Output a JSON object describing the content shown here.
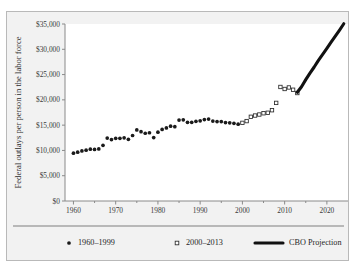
{
  "chart_data": {
    "type": "scatter",
    "title": "",
    "xlabel": "",
    "ylabel": "Federal outlays per person in the labor force",
    "xlim": [
      1958,
      2025
    ],
    "ylim": [
      0,
      35000
    ],
    "grid": false,
    "legend_position": "bottom",
    "y_ticks": [
      0,
      5000,
      10000,
      15000,
      20000,
      25000,
      30000,
      35000
    ],
    "y_tick_labels": [
      "$0",
      "$5,000",
      "$10,000",
      "$15,000",
      "$20,000",
      "$25,000",
      "$30,000",
      "$35,000"
    ],
    "x_ticks": [
      1960,
      1970,
      1980,
      1990,
      2000,
      2010,
      2020
    ],
    "x_tick_labels": [
      "1960",
      "1970",
      "1980",
      "1990",
      "2000",
      "2010",
      "2020"
    ],
    "x_minor_ticks": [
      1965,
      1975,
      1985,
      1995,
      2005,
      2015
    ],
    "series": [
      {
        "name": "1960–1999",
        "marker": "filled-circle",
        "color": "#1a1a1a",
        "x": [
          1960,
          1961,
          1962,
          1963,
          1964,
          1965,
          1966,
          1967,
          1968,
          1969,
          1970,
          1971,
          1972,
          1973,
          1974,
          1975,
          1976,
          1977,
          1978,
          1979,
          1980,
          1981,
          1982,
          1983,
          1984,
          1985,
          1986,
          1987,
          1988,
          1989,
          1990,
          1991,
          1992,
          1993,
          1994,
          1995,
          1996,
          1997,
          1998,
          1999
        ],
        "y": [
          9450,
          9650,
          9900,
          10050,
          10250,
          10200,
          10300,
          11000,
          12450,
          12150,
          12400,
          12400,
          12500,
          12200,
          12950,
          14050,
          13700,
          13400,
          13500,
          12550,
          13600,
          14150,
          14450,
          14800,
          14700,
          16000,
          16050,
          15550,
          15550,
          15750,
          15850,
          16100,
          16200,
          15800,
          15700,
          15700,
          15500,
          15450,
          15350,
          15200
        ]
      },
      {
        "name": "2000–2013",
        "marker": "open-square",
        "color": "#ffffff",
        "x": [
          2000,
          2001,
          2002,
          2003,
          2004,
          2005,
          2006,
          2007,
          2008,
          2009,
          2010,
          2011,
          2012,
          2013
        ],
        "y": [
          15450,
          15800,
          16650,
          16900,
          17100,
          17350,
          17450,
          17950,
          19400,
          22550,
          22150,
          22450,
          22000,
          21350
        ]
      },
      {
        "name": "CBO Projection",
        "marker": "line",
        "color": "#111111",
        "x": [
          2013,
          2014,
          2015,
          2016,
          2017,
          2018,
          2019,
          2020,
          2021,
          2022,
          2023,
          2024
        ],
        "y": [
          21500,
          22600,
          24000,
          25300,
          26500,
          27800,
          29000,
          30200,
          31400,
          32600,
          33800,
          35050
        ]
      }
    ]
  },
  "legend": {
    "items": [
      {
        "label": "1960–1999",
        "marker": "filled-circle"
      },
      {
        "label": "2000–2013",
        "marker": "open-square"
      },
      {
        "label": "CBO Projection",
        "marker": "thick-line"
      }
    ]
  }
}
